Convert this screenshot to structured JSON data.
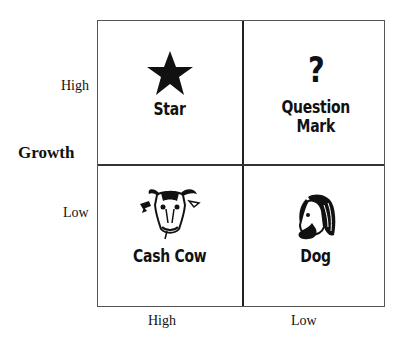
{
  "diagram": {
    "type": "BCG growth-share matrix",
    "y_axis": {
      "title": "Growth",
      "ticks": [
        "High",
        "Low"
      ]
    },
    "x_axis": {
      "ticks": [
        "High",
        "Low"
      ]
    },
    "quadrants": [
      {
        "position": "top-left",
        "icon": "star-icon",
        "label": "Star"
      },
      {
        "position": "top-right",
        "icon": "question-mark-icon",
        "label": "Question Mark",
        "label_lines": [
          "Question",
          "Mark"
        ]
      },
      {
        "position": "bottom-left",
        "icon": "cow-head-icon",
        "label": "Cash Cow"
      },
      {
        "position": "bottom-right",
        "icon": "dog-head-icon",
        "label": "Dog"
      }
    ]
  }
}
